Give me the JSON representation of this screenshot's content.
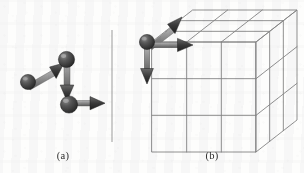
{
  "figure": {
    "title": "",
    "background_color": "#fdfdfc",
    "panels": [
      {
        "id": "a",
        "caption": "(a)",
        "description": "three-node chain of spheres joined by arrows",
        "node_color": "#4b4b4b",
        "arrow_color": "#3f3f3f",
        "shaft_color": "#9a9a9a",
        "nodes": [
          {
            "name": "node-left",
            "cx": 28,
            "cy": 82,
            "r": 7.5
          },
          {
            "name": "node-top",
            "cx": 66,
            "cy": 60,
            "r": 8.0
          },
          {
            "name": "node-bottom",
            "cx": 69,
            "cy": 104,
            "r": 8.5
          }
        ],
        "arrows": [
          {
            "name": "arrow-left-to-top",
            "x1": 31,
            "y1": 80,
            "x2": 62,
            "y2": 63,
            "label": "diagonal-up-right"
          },
          {
            "name": "arrow-top-to-bottom",
            "x1": 67,
            "y1": 66,
            "x2": 68,
            "y2": 99,
            "label": "vertical-down"
          },
          {
            "name": "arrow-bottom-to-right",
            "x1": 75,
            "y1": 103,
            "x2": 100,
            "y2": 103,
            "label": "horizontal-right"
          }
        ]
      },
      {
        "id": "b",
        "caption": "(b)",
        "description": "3x3x3 isometric lattice of cubes with three basis arrows at the front-top-left corner",
        "grid_color": "#858585",
        "grid_divisions": 3,
        "node_color": "#4b4b4b",
        "arrow_color": "#3f3f3f",
        "shaft_color": "#9a9a9a",
        "cube": {
          "front_left": 152,
          "front_right": 256,
          "front_top": 42,
          "front_bottom": 152,
          "depth_dx": 41,
          "depth_dy": -32
        },
        "origin_node": {
          "name": "origin-node",
          "cx": 147,
          "cy": 42,
          "r": 7.5
        },
        "arrows": [
          {
            "name": "arrow-depth",
            "x1": 151,
            "y1": 39,
            "x2": 177,
            "y2": 19,
            "label": "into-page-up-right"
          },
          {
            "name": "arrow-horizontal",
            "x1": 153,
            "y1": 45,
            "x2": 188,
            "y2": 45,
            "label": "right"
          },
          {
            "name": "arrow-vertical",
            "x1": 147,
            "y1": 49,
            "x2": 147,
            "y2": 78,
            "label": "down"
          }
        ]
      }
    ],
    "divider": {
      "name": "panel-divider",
      "x": 112,
      "y1": 30,
      "y2": 142,
      "color": "#9b9b9b"
    }
  }
}
